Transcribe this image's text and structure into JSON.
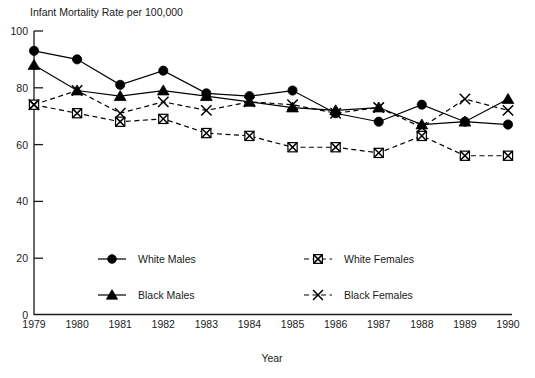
{
  "chart_data": {
    "type": "line",
    "title": "Infant Mortality Rate per 100,000",
    "xlabel": "Year",
    "ylabel": "",
    "grid": false,
    "legend_position": "inside-bottom",
    "xlim": [
      1979,
      1990
    ],
    "ylim": [
      0,
      100
    ],
    "ytick_labels": [
      "0",
      "20",
      "40",
      "60",
      "80",
      "100"
    ],
    "yticks": [
      0,
      20,
      40,
      60,
      80,
      100
    ],
    "categories": [
      1979,
      1980,
      1981,
      1982,
      1983,
      1984,
      1985,
      1986,
      1987,
      1988,
      1989,
      1990
    ],
    "xtick_labels": [
      "1979",
      "1980",
      "1981",
      "1982",
      "1983",
      "1984",
      "1985",
      "1986",
      "1987",
      "1988",
      "1989",
      "1990"
    ],
    "series": [
      {
        "name": "White Males",
        "marker": "filled-circle",
        "line_style": "solid",
        "color": "#000000",
        "values": [
          93,
          90,
          81,
          86,
          78,
          77,
          79,
          71,
          68,
          74,
          68,
          67
        ]
      },
      {
        "name": "Black Males",
        "marker": "filled-triangle",
        "line_style": "solid",
        "color": "#000000",
        "values": [
          88,
          79,
          77,
          79,
          77,
          75,
          73,
          72,
          73,
          67,
          68,
          76
        ]
      },
      {
        "name": "White Females",
        "marker": "open-square-x",
        "line_style": "dashed",
        "color": "#000000",
        "values": [
          74,
          71,
          68,
          69,
          64,
          63,
          59,
          59,
          57,
          63,
          56,
          56
        ]
      },
      {
        "name": "Black Females",
        "marker": "x",
        "line_style": "dashed",
        "color": "#000000",
        "values": [
          74,
          79,
          71,
          75,
          72,
          75,
          74,
          71,
          73,
          66,
          76,
          72
        ]
      }
    ]
  },
  "legend": {
    "entries": [
      {
        "label": "White Males",
        "marker": "filled-circle",
        "line_style": "solid"
      },
      {
        "label": "White Females",
        "marker": "open-square-x",
        "line_style": "dashed"
      },
      {
        "label": "Black Males",
        "marker": "filled-triangle",
        "line_style": "solid"
      },
      {
        "label": "Black Females",
        "marker": "x",
        "line_style": "dashed"
      }
    ]
  }
}
